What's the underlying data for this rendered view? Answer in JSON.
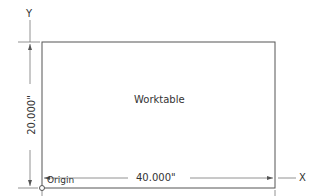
{
  "diagram": {
    "title": "Worktable",
    "axes": {
      "x_label": "X",
      "y_label": "Y"
    },
    "origin_label": "Origin",
    "dimensions": {
      "width": "40.000\"",
      "height": "20.000\""
    },
    "colors": {
      "line": "#555555",
      "text": "#333333",
      "background": "#ffffff"
    }
  }
}
